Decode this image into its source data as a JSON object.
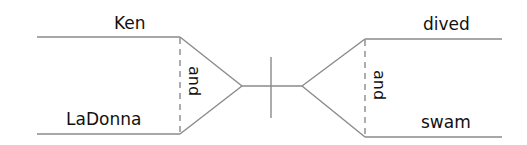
{
  "diagram": {
    "type": "sentence-diagram",
    "subject": {
      "words": [
        "Ken",
        "LaDonna"
      ],
      "conjunction": "and"
    },
    "predicate": {
      "words": [
        "dived",
        "swam"
      ],
      "conjunction": "and"
    },
    "colors": {
      "line": "#8a8a8a",
      "text": "#111111",
      "background": "#ffffff"
    }
  }
}
